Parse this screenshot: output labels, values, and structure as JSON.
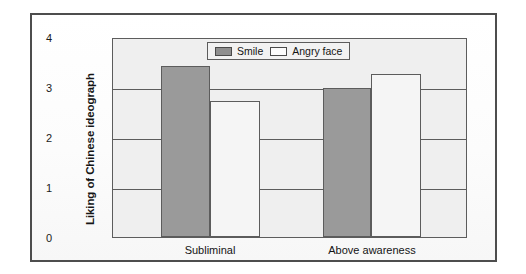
{
  "chart_data": {
    "type": "bar",
    "title": "",
    "subtitle": "",
    "xlabel": "",
    "ylabel": "Liking of Chinese ideograph",
    "categories": [
      "Subliminal",
      "Above awareness"
    ],
    "series": [
      {
        "name": "Smile",
        "values": [
          3.45,
          3.02
        ],
        "color": "#9a9a9a"
      },
      {
        "name": "Angry face",
        "values": [
          2.74,
          3.3
        ],
        "color": "#f5f5f5"
      }
    ],
    "ylim": [
      0,
      4
    ],
    "y_ticks": [
      0,
      1,
      2,
      3,
      4
    ],
    "y_tick_labels": [
      "0",
      "1",
      "2",
      "3",
      "4"
    ],
    "grid": true,
    "legend_position": "top-center",
    "legend_entries": [
      "Smile",
      "Angry face"
    ]
  },
  "figure": {
    "frame_color": "#4d4d4d",
    "plot_bg": "#efefef",
    "axis_color": "#5c5c5c"
  }
}
